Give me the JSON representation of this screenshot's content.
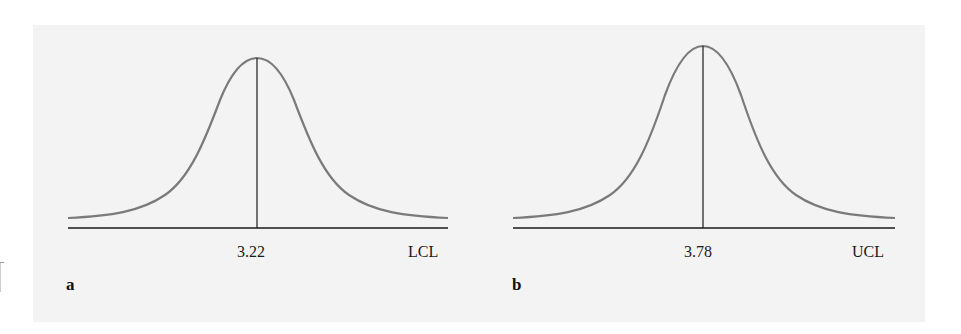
{
  "figure": {
    "background_color": "#f3f3f3",
    "curve_color": "#7a7a7a",
    "axis_color": "#1a1a1a",
    "panels": [
      {
        "letter": "a",
        "center_label": "3.22",
        "limit_label": "LCL",
        "description": "Normal distribution curve centered at 3.22 with lower control limit marked at right"
      },
      {
        "letter": "b",
        "center_label": "3.78",
        "limit_label": "UCL",
        "description": "Normal distribution curve centered at 3.78 with upper control limit marked at right"
      }
    ]
  }
}
